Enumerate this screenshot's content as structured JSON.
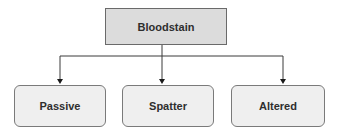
{
  "diagram": {
    "type": "hierarchy",
    "root": {
      "label": "Bloodstain",
      "fill": "#dcdcdc",
      "border": "#6a6a6a"
    },
    "children": [
      {
        "label": "Passive",
        "fill": "#efefef",
        "border": "#7a7a7a"
      },
      {
        "label": "Spatter",
        "fill": "#efefef",
        "border": "#7a7a7a"
      },
      {
        "label": "Altered",
        "fill": "#efefef",
        "border": "#7a7a7a"
      }
    ],
    "edges": [
      {
        "from": "Bloodstain",
        "to": "Passive",
        "style": "arrow"
      },
      {
        "from": "Bloodstain",
        "to": "Spatter",
        "style": "arrow"
      },
      {
        "from": "Bloodstain",
        "to": "Altered",
        "style": "arrow"
      }
    ],
    "line_color": "#3a3a3a"
  }
}
